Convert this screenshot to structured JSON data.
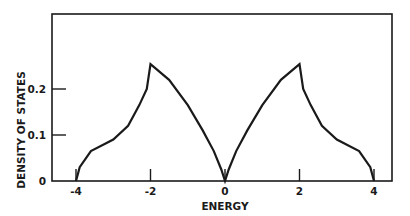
{
  "chart_data": {
    "type": "line",
    "title": "",
    "xlabel": "ENERGY",
    "ylabel": "DENSITY OF STATES",
    "xlim": [
      -4,
      4
    ],
    "ylim": [
      0,
      0.25
    ],
    "x_ticks": [
      "-4",
      "-2",
      "0",
      "2",
      "4"
    ],
    "y_ticks": [
      "0",
      "0.1",
      "0.2"
    ],
    "grid": false,
    "legend": null,
    "series": [
      {
        "name": "density of states",
        "x": [
          -4.0,
          -3.9,
          -3.6,
          -3.0,
          -2.6,
          -2.3,
          -2.1,
          -2.0,
          -1.5,
          -1.0,
          -0.6,
          -0.3,
          -0.1,
          0.0,
          0.1,
          0.3,
          0.6,
          1.0,
          1.5,
          2.0,
          2.1,
          2.3,
          2.6,
          3.0,
          3.6,
          3.9,
          4.0
        ],
        "y": [
          0.0,
          0.03,
          0.065,
          0.09,
          0.12,
          0.165,
          0.2,
          0.254,
          0.22,
          0.165,
          0.11,
          0.065,
          0.025,
          0.0,
          0.025,
          0.065,
          0.11,
          0.165,
          0.22,
          0.254,
          0.2,
          0.165,
          0.12,
          0.09,
          0.065,
          0.03,
          0.0
        ]
      }
    ],
    "features": {
      "van_hove_peaks": [
        {
          "x": -2,
          "y": 0.254
        },
        {
          "x": 2,
          "y": 0.254
        }
      ],
      "band_edges": [
        -4,
        4
      ],
      "zero_at": 0
    }
  },
  "axes": {
    "xlabel": "ENERGY",
    "ylabel": "DENSITY OF STATES",
    "x_ticks": [
      "-4",
      "-2",
      "0",
      "2",
      "4"
    ],
    "y_ticks": [
      "0",
      "0.1",
      "0.2"
    ]
  },
  "colors": {
    "line": "#1a1a1a",
    "background": "#ffffff"
  }
}
